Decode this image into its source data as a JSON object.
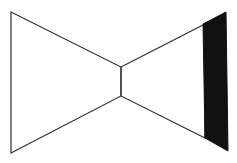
{
  "diagram": {
    "title": "",
    "stroke_color": "#333333",
    "fill_color": "#111111",
    "background": "#ffffff",
    "shapes": {
      "left_trapezoid": "11,12 121,67 121,96 11,153",
      "right_trapezoid": "121,67 205,24 205,138 121,96",
      "dark_panel": "203,24 226,12 228,151 205,138"
    }
  }
}
